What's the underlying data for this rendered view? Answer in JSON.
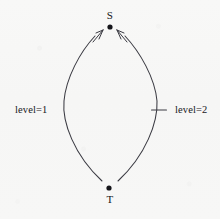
{
  "figure": {
    "type": "directed-graph-diagram",
    "background_color": "#f7f7f6",
    "stroke_color": "#3a3a42",
    "text_color": "#15151a",
    "width": 220,
    "height": 219
  },
  "nodes": [
    {
      "id": "S",
      "label": "S",
      "role": "source-node",
      "x": 110,
      "y": 27,
      "label_position": "above"
    },
    {
      "id": "T",
      "label": "T",
      "role": "target-node",
      "x": 109,
      "y": 188,
      "label_position": "below"
    }
  ],
  "edges": [
    {
      "id": "left-arc",
      "from": "T",
      "to": "S",
      "direction": "upward",
      "arrowhead": "at-S",
      "curvature": "bows-left",
      "label": "level=1",
      "label_side": "left",
      "tick_mark": false
    },
    {
      "id": "right-arc",
      "from": "T",
      "to": "S",
      "direction": "upward",
      "arrowhead": "at-S",
      "curvature": "bows-right",
      "label": "level=2",
      "label_side": "right",
      "tick_mark": true
    }
  ],
  "labels": {
    "node_s": "S",
    "node_t": "T",
    "edge_left": "level=1",
    "edge_right": "level=2"
  }
}
